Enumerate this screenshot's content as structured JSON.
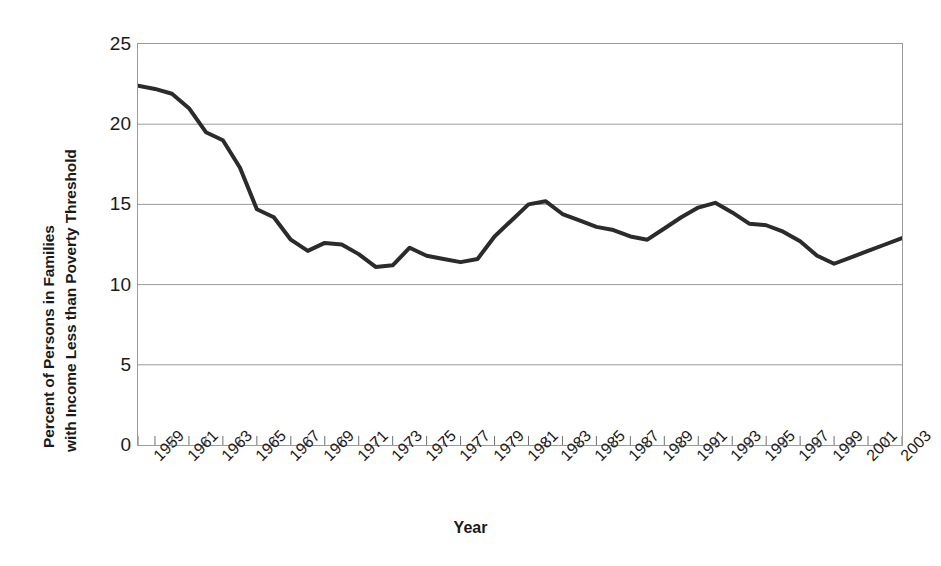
{
  "chart_data": {
    "type": "line",
    "title": "",
    "xlabel": "Year",
    "ylabel_line1": "Percent of Persons in Families",
    "ylabel_line2": "with Income Less than Poverty Threshold",
    "ylim": [
      0,
      25
    ],
    "yticks": [
      25,
      20,
      15,
      10,
      5,
      0
    ],
    "ytick_labels": [
      "25",
      "20",
      "15",
      "10",
      "5",
      "0"
    ],
    "xlim": [
      1959,
      2004
    ],
    "xtick_labels": [
      "1959",
      "1961",
      "1963",
      "1965",
      "1967",
      "1969",
      "1971",
      "1973",
      "1975",
      "1977",
      "1979",
      "1981",
      "1983",
      "1985",
      "1987",
      "1989",
      "1991",
      "1993",
      "1995",
      "1997",
      "1999",
      "2001",
      "2003"
    ],
    "grid": "horizontal",
    "legend": "none",
    "line_color": "#2b2b2b",
    "line_width": 4,
    "x": [
      1959,
      1960,
      1961,
      1962,
      1963,
      1964,
      1965,
      1966,
      1967,
      1968,
      1969,
      1970,
      1971,
      1972,
      1973,
      1974,
      1975,
      1976,
      1977,
      1978,
      1979,
      1980,
      1981,
      1982,
      1983,
      1984,
      1985,
      1986,
      1987,
      1988,
      1989,
      1990,
      1991,
      1992,
      1993,
      1994,
      1995,
      1996,
      1997,
      1998,
      1999,
      2000,
      2001,
      2002,
      2003,
      2004
    ],
    "values": [
      22.4,
      22.2,
      21.9,
      21.0,
      19.5,
      19.0,
      17.3,
      14.7,
      14.2,
      12.8,
      12.1,
      12.6,
      12.5,
      11.9,
      11.1,
      11.2,
      12.3,
      11.8,
      11.6,
      11.4,
      11.6,
      13.0,
      14.0,
      15.0,
      15.2,
      14.4,
      14.0,
      13.6,
      13.4,
      13.0,
      12.8,
      13.5,
      14.2,
      14.8,
      15.1,
      14.5,
      13.8,
      13.7,
      13.3,
      12.7,
      11.8,
      11.3,
      11.7,
      12.1,
      12.5,
      12.9
    ],
    "series_name": "Percent of persons in families below poverty threshold"
  }
}
